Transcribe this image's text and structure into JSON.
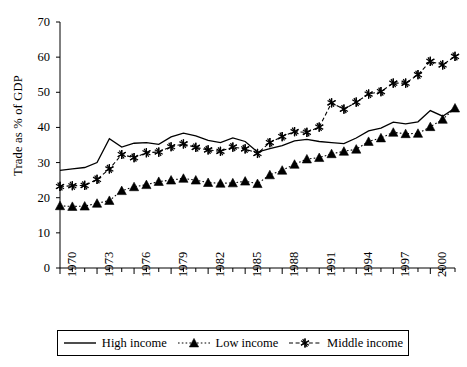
{
  "chart_data": {
    "type": "line",
    "title": "",
    "xlabel": "",
    "ylabel": "Trade as % of GDP",
    "xlim": [
      1970,
      2002
    ],
    "ylim": [
      0,
      70
    ],
    "ytick_values": [
      0,
      10,
      20,
      30,
      40,
      50,
      60,
      70
    ],
    "ytick_labels": [
      "0",
      "10",
      "20",
      "30",
      "40",
      "50",
      "60",
      "70"
    ],
    "xtick_labels": [
      "1970",
      "1973",
      "1976",
      "1979",
      "1982",
      "1985",
      "1988",
      "1991",
      "1994",
      "1997",
      "2000"
    ],
    "xtick_label_values": [
      1970,
      1973,
      1976,
      1979,
      1982,
      1985,
      1988,
      1991,
      1994,
      1997,
      2000
    ],
    "x": [
      1970,
      1971,
      1972,
      1973,
      1974,
      1975,
      1976,
      1977,
      1978,
      1979,
      1980,
      1981,
      1982,
      1983,
      1984,
      1985,
      1986,
      1987,
      1988,
      1989,
      1990,
      1991,
      1992,
      1993,
      1994,
      1995,
      1996,
      1997,
      1998,
      1999,
      2000,
      2001,
      2002
    ],
    "grid": false,
    "legend_position": "bottom",
    "series": [
      {
        "name": "High income",
        "marker": "none",
        "linestyle": "solid",
        "color": "#000000",
        "values": [
          27.8,
          28.2,
          28.6,
          30.0,
          36.8,
          34.4,
          35.5,
          35.7,
          35.2,
          37.3,
          38.4,
          37.6,
          36.3,
          35.7,
          37.0,
          36.0,
          33.0,
          34.0,
          34.8,
          36.2,
          36.6,
          36.0,
          35.7,
          35.4,
          37.0,
          39.0,
          39.8,
          41.5,
          41.0,
          41.6,
          44.8,
          43.2,
          45.5
        ]
      },
      {
        "name": "Low income",
        "marker": "triangle",
        "linestyle": "dotted",
        "color": "#000000",
        "values": [
          17.7,
          17.5,
          17.6,
          18.4,
          19.2,
          22.0,
          23.1,
          23.7,
          24.6,
          25.0,
          25.5,
          25.0,
          24.3,
          24.1,
          24.2,
          24.7,
          24.0,
          26.5,
          27.8,
          29.5,
          31.0,
          31.4,
          32.5,
          33.2,
          33.8,
          36.0,
          37.0,
          38.6,
          38.2,
          38.3,
          40.2,
          42.3,
          45.5
        ]
      },
      {
        "name": "Middle income",
        "marker": "asterisk",
        "linestyle": "dashed",
        "color": "#000000",
        "values": [
          23.2,
          23.4,
          23.5,
          25.2,
          28.2,
          32.3,
          31.4,
          32.8,
          33.0,
          34.5,
          35.3,
          34.3,
          33.6,
          33.2,
          34.4,
          33.9,
          32.6,
          35.7,
          37.4,
          38.8,
          38.6,
          40.1,
          47.0,
          45.2,
          47.2,
          49.5,
          50.2,
          52.6,
          52.6,
          55.0,
          58.8,
          57.8,
          60.2
        ]
      }
    ]
  },
  "legend": {
    "items": [
      {
        "label": "High income",
        "key": "solid-line-key"
      },
      {
        "label": "Low income",
        "key": "triangle-marker-key"
      },
      {
        "label": "Middle income",
        "key": "asterisk-marker-key"
      }
    ]
  }
}
